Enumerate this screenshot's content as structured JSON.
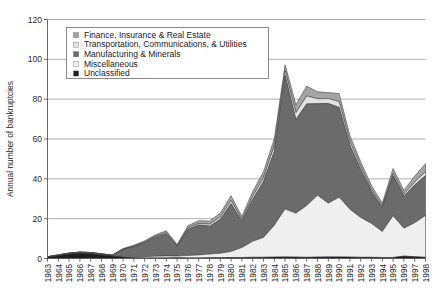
{
  "chart_data": {
    "type": "area",
    "stacked": true,
    "title": "",
    "xlabel": "",
    "ylabel": "Annual number of bankruptcies",
    "ylim": [
      0,
      120
    ],
    "yticks": [
      0,
      20,
      40,
      60,
      80,
      100,
      120
    ],
    "grid": true,
    "legend_position": "top-left-inside",
    "categories": [
      "1963",
      "1964",
      "1965",
      "1966",
      "1967",
      "1968",
      "1969",
      "1970",
      "1971",
      "1972",
      "1973",
      "1974",
      "1975",
      "1976",
      "1977",
      "1978",
      "1979",
      "1980",
      "1981",
      "1982",
      "1983",
      "1984",
      "1985",
      "1986",
      "1987",
      "1988",
      "1989",
      "1990",
      "1991",
      "1992",
      "1993",
      "1994",
      "1995",
      "1996",
      "1997",
      "1998"
    ],
    "series": [
      {
        "name": "Unclassified",
        "color": "#1c1c1c",
        "values": [
          0.6,
          1.4,
          2.2,
          2.6,
          2.4,
          1.8,
          1.2,
          0.7,
          0.4,
          0.3,
          0.3,
          0.3,
          0.4,
          0.3,
          0.3,
          0.4,
          0.4,
          0.5,
          0.5,
          0.6,
          0.6,
          0.7,
          0.8,
          0.7,
          0.6,
          0.7,
          0.8,
          0.8,
          0.7,
          0.6,
          0.6,
          0.5,
          0.5,
          1.2,
          0.9,
          0.6
        ]
      },
      {
        "name": "Miscellaneous",
        "color": "#efefef",
        "values": [
          0.0,
          0.0,
          0.0,
          0.0,
          0.0,
          0.0,
          0.0,
          0.3,
          0.5,
          0.6,
          0.8,
          1.0,
          0.8,
          1.2,
          1.5,
          1.8,
          2.2,
          3.0,
          5.0,
          8.0,
          10.0,
          16.0,
          24.0,
          22.0,
          26.0,
          31.0,
          27.0,
          30.0,
          24.0,
          20.0,
          17.0,
          13.0,
          21.0,
          14.0,
          17.0,
          21.0
        ]
      },
      {
        "name": "Manufacturing & Minerals",
        "color": "#6b6b6b",
        "values": [
          0.3,
          0.4,
          0.5,
          0.6,
          0.6,
          0.5,
          0.5,
          3.5,
          5.0,
          7.0,
          9.5,
          11.0,
          5.0,
          13.0,
          15.0,
          14.0,
          17.0,
          24.0,
          13.0,
          21.0,
          28.0,
          37.0,
          67.0,
          47.0,
          51.0,
          46.0,
          50.0,
          45.0,
          32.0,
          24.0,
          16.0,
          12.0,
          20.0,
          16.0,
          19.0,
          20.0
        ]
      },
      {
        "name": "Transportation, Communications, & Utilities",
        "color": "#e2e2e2",
        "values": [
          0.0,
          0.0,
          0.0,
          0.0,
          0.0,
          0.0,
          0.0,
          0.2,
          0.3,
          0.4,
          0.5,
          0.6,
          0.3,
          0.7,
          0.8,
          1.0,
          1.2,
          1.6,
          1.0,
          1.5,
          2.0,
          3.0,
          2.5,
          3.5,
          4.0,
          2.5,
          2.5,
          3.0,
          2.0,
          1.5,
          1.0,
          0.8,
          1.2,
          1.0,
          1.5,
          2.0
        ]
      },
      {
        "name": "Finance, Insurance & Real Estate",
        "color": "#a4a4a4",
        "values": [
          0.0,
          0.0,
          0.0,
          0.0,
          0.0,
          0.0,
          0.0,
          0.3,
          0.5,
          0.6,
          0.8,
          1.0,
          0.5,
          1.2,
          1.4,
          1.6,
          2.0,
          2.4,
          1.6,
          2.5,
          3.0,
          3.5,
          3.0,
          4.0,
          5.0,
          3.5,
          3.0,
          4.0,
          3.0,
          2.5,
          2.0,
          1.5,
          2.5,
          2.0,
          3.0,
          4.0
        ]
      }
    ],
    "totals": [
      0.9,
      1.8,
      2.7,
      3.2,
      3.0,
      2.3,
      1.7,
      5.0,
      6.7,
      8.9,
      11.9,
      13.9,
      7.0,
      16.4,
      19.0,
      18.8,
      22.8,
      31.5,
      21.1,
      33.6,
      43.6,
      60.2,
      97.3,
      77.2,
      86.6,
      83.7,
      83.3,
      82.8,
      61.7,
      48.6,
      36.6,
      27.8,
      45.2,
      34.2,
      41.4,
      47.6
    ]
  },
  "legend": {
    "items": [
      {
        "label": "Finance, Insurance & Real Estate",
        "color": "#a4a4a4"
      },
      {
        "label": "Transportation, Communications, & Utilities",
        "color": "#e2e2e2"
      },
      {
        "label": "Manufacturing & Minerals",
        "color": "#6b6b6b"
      },
      {
        "label": "Miscellaneous",
        "color": "#efefef"
      },
      {
        "label": "Unclassified",
        "color": "#1c1c1c"
      }
    ]
  }
}
